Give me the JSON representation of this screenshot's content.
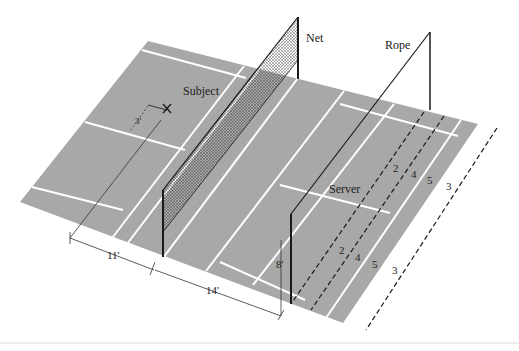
{
  "diagram": {
    "type": "badminton court perspective setup",
    "colors": {
      "background": "#ffffff",
      "court": "#a8a8a8",
      "court_lines": "#ffffff",
      "ink": "#1a1a1a"
    },
    "labels": {
      "net": "Net",
      "rope": "Rope",
      "subject": "Subject",
      "server": "Server",
      "subject_offset": "3'",
      "subject_marker": "X"
    },
    "dimensions": {
      "subject_to_net": "11'",
      "net_to_rope": "14'",
      "rope_height": "8'"
    },
    "zone_numbers": {
      "upper_row": [
        "2",
        "4",
        "5",
        "3"
      ],
      "lower_row": [
        "2",
        "4",
        "5",
        "3"
      ]
    }
  }
}
